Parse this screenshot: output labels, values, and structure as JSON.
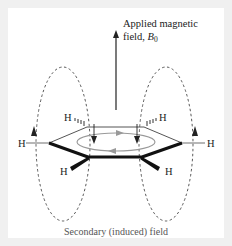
{
  "diagram": {
    "type": "benzene-ring-current",
    "applied_field_label_line1": "Applied magnetic",
    "applied_field_label_line2": "field, ",
    "applied_field_symbol": "B",
    "applied_field_subscript": "0",
    "hydrogen_label": "H",
    "caption": "Secondary (induced) field",
    "colors": {
      "background": "#f0f0f0",
      "panel": "#ffffff",
      "ink": "#222222",
      "ring_current": "#999999",
      "field_lines": "#444444"
    }
  }
}
